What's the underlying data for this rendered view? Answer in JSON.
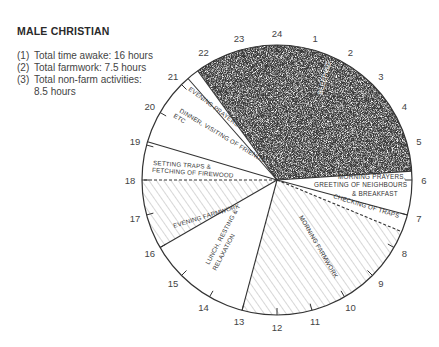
{
  "title": "MALE CHRISTIAN",
  "notes": [
    {
      "num": "(1)",
      "text": "Total time awake: 16 hours"
    },
    {
      "num": "(2)",
      "text": "Total farmwork: 7.5 hours"
    },
    {
      "num": "(3)",
      "text": "Total non-farm activities:",
      "text2": "8.5 hours"
    }
  ],
  "clock": {
    "hours": [
      "24",
      "1",
      "2",
      "3",
      "4",
      "5",
      "6",
      "7",
      "8",
      "9",
      "10",
      "11",
      "12",
      "13",
      "14",
      "15",
      "16",
      "17",
      "18",
      "19",
      "20",
      "21",
      "22",
      "23"
    ]
  },
  "segments": [
    {
      "label": "SLEEPING",
      "start": 21.6,
      "end": 5.75,
      "fill": "stipple"
    },
    {
      "label": "MORNING PRAYERS, GREETING OF NEIGHBOURS & BREAKFAST",
      "start": 5.75,
      "end": 7.0,
      "fill": "white"
    },
    {
      "label": "CHECKING OF TRAPS",
      "start": 7.0,
      "end": 7.5,
      "fill": "white"
    },
    {
      "label": "MORNING FARMWORK",
      "start": 7.5,
      "end": 13.0,
      "fill": "hatch"
    },
    {
      "label": "LUNCH, RESTING & RELAXATION",
      "start": 13.0,
      "end": 16.0,
      "fill": "white"
    },
    {
      "label": "EVENING FARMWORK",
      "start": 16.0,
      "end": 18.0,
      "fill": "hatch"
    },
    {
      "label": "SETTING TRAPS & FETCHING OF FIREWOOD",
      "start": 18.0,
      "end": 19.1,
      "fill": "white"
    },
    {
      "label": "DINNER, VISITING OF FRIENDS ETC",
      "start": 19.1,
      "end": 21.25,
      "fill": "white"
    },
    {
      "label": "EVENING PRAYERS",
      "start": 21.25,
      "end": 21.6,
      "fill": "white"
    }
  ],
  "labels": {
    "sleeping": "SLEEPING",
    "morning_prayers_1": "MORNING PRAYERS,",
    "morning_prayers_2": "GREETING OF NEIGHBOURS",
    "morning_prayers_3": "& BREAKFAST",
    "checking_traps": "CHECKING OF TRAPS",
    "morning_farmwork": "MORNING FARMWORK",
    "lunch_1": "LUNCH, RESTING &",
    "lunch_2": "RELAXATION",
    "evening_farmwork": "EVENING FARMWORK",
    "setting_traps_1": "SETTING TRAPS &",
    "setting_traps_2": "FETCHING OF FIREWOOD",
    "dinner_1": "DINNER, VISITING OF FRIENDS",
    "dinner_2": "ETC",
    "evening_prayers": "EVENING PRAYERS"
  }
}
